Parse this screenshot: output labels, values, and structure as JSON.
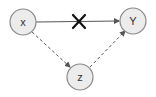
{
  "diagram": {
    "type": "causal-dag",
    "nodes": [
      {
        "id": "x",
        "label": "x",
        "cx": 23,
        "cy": 22
      },
      {
        "id": "y",
        "label": "Y",
        "cx": 133,
        "cy": 21
      },
      {
        "id": "z",
        "label": "z",
        "cx": 80,
        "cy": 77
      }
    ],
    "edges": [
      {
        "from": "x",
        "to": "y",
        "style": "solid",
        "blocked": true,
        "blocked_marker": "cross-icon"
      },
      {
        "from": "x",
        "to": "z",
        "style": "dashed"
      },
      {
        "from": "z",
        "to": "y",
        "style": "dashed"
      }
    ],
    "colors": {
      "node_fill": "#ececec",
      "node_stroke": "#8a8a8a",
      "edge": "#555555",
      "cross": "#111111"
    }
  }
}
